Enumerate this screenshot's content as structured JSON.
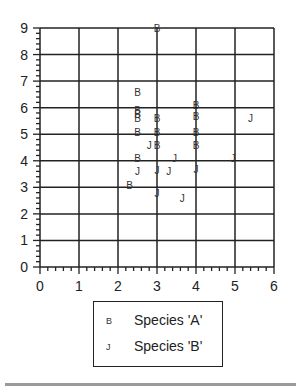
{
  "chart_data": {
    "type": "scatter",
    "title": "",
    "xlabel": "",
    "ylabel": "",
    "xlim": [
      0,
      6
    ],
    "ylim": [
      0,
      9
    ],
    "xticks": [
      "0",
      "1",
      "2",
      "3",
      "4",
      "5",
      "6"
    ],
    "yticks": [
      "0",
      "1",
      "2",
      "3",
      "4",
      "5",
      "6",
      "7",
      "8",
      "9"
    ],
    "grid": true,
    "legend_position": "below",
    "series": [
      {
        "name": "Species 'A'",
        "marker": "B",
        "points": [
          [
            3.0,
            9.0
          ],
          [
            2.5,
            6.6
          ],
          [
            2.5,
            5.9
          ],
          [
            2.5,
            5.75
          ],
          [
            2.5,
            5.6
          ],
          [
            2.5,
            5.1
          ],
          [
            3.0,
            5.6
          ],
          [
            3.0,
            5.1
          ],
          [
            3.0,
            4.6
          ],
          [
            2.5,
            4.1
          ],
          [
            2.3,
            3.1
          ],
          [
            4.0,
            6.1
          ],
          [
            4.0,
            5.7
          ],
          [
            4.0,
            5.1
          ],
          [
            4.0,
            4.6
          ]
        ]
      },
      {
        "name": "Species 'B'",
        "marker": "J",
        "points": [
          [
            2.8,
            4.6
          ],
          [
            3.45,
            4.1
          ],
          [
            2.5,
            3.6
          ],
          [
            3.0,
            3.65
          ],
          [
            3.3,
            3.6
          ],
          [
            3.0,
            2.8
          ],
          [
            3.65,
            2.6
          ],
          [
            4.0,
            3.7
          ],
          [
            4.95,
            4.1
          ],
          [
            5.4,
            5.6
          ]
        ]
      }
    ]
  },
  "legend": {
    "items": [
      {
        "marker": "B",
        "label": "Species 'A'"
      },
      {
        "marker": "J",
        "label": "Species 'B'"
      }
    ]
  }
}
